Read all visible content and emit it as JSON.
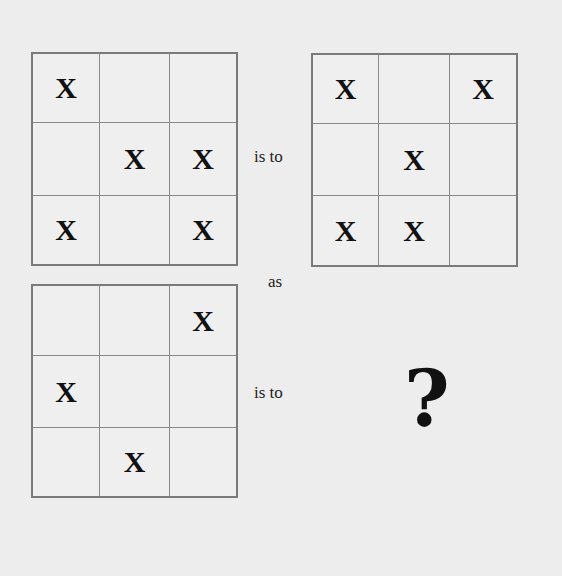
{
  "puzzle": {
    "type": "analogy",
    "mark": "X",
    "connector_is_to": "is to",
    "connector_as": "as",
    "unknown_symbol": "?",
    "grids": [
      {
        "id": "grid-a",
        "cells": [
          [
            "X",
            "",
            ""
          ],
          [
            "",
            "X",
            "X"
          ],
          [
            "X",
            "",
            "X"
          ]
        ]
      },
      {
        "id": "grid-b",
        "cells": [
          [
            "X",
            "",
            "X"
          ],
          [
            "",
            "X",
            ""
          ],
          [
            "X",
            "X",
            ""
          ]
        ]
      },
      {
        "id": "grid-c",
        "cells": [
          [
            "",
            "",
            "X"
          ],
          [
            "X",
            "",
            ""
          ],
          [
            "",
            "X",
            ""
          ]
        ]
      }
    ]
  },
  "colors": {
    "background": "#ededed",
    "grid_border": "#7a7a7a",
    "grid_line": "#8a8a8a",
    "text": "#111111"
  }
}
